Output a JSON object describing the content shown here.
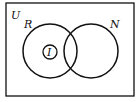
{
  "diagram": {
    "type": "venn",
    "universe_label": "U",
    "sets": [
      {
        "label": "R"
      },
      {
        "label": "N"
      },
      {
        "label": "I",
        "subset_of": "R"
      }
    ],
    "colors": {
      "stroke": "#111111",
      "background": "#ffffff"
    }
  }
}
